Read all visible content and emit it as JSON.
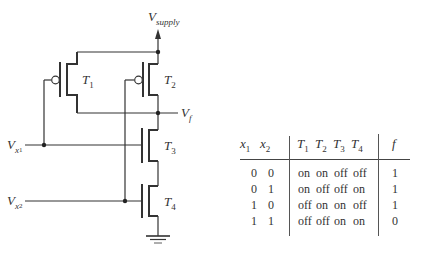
{
  "circuit": {
    "supply_label": {
      "main": "V",
      "sub": "supply"
    },
    "output_label": {
      "main": "V",
      "sub": "f"
    },
    "input1_label": {
      "main": "V",
      "sub": "x",
      "subsub": "1"
    },
    "input2_label": {
      "main": "V",
      "sub": "x",
      "subsub": "2"
    },
    "transistors": [
      {
        "label": "T",
        "sub": "1",
        "type": "pmos"
      },
      {
        "label": "T",
        "sub": "2",
        "type": "pmos"
      },
      {
        "label": "T",
        "sub": "3",
        "type": "nmos"
      },
      {
        "label": "T",
        "sub": "4",
        "type": "nmos"
      }
    ]
  },
  "truth_table": {
    "headers": [
      {
        "main": "x",
        "sub": "1"
      },
      {
        "main": "x",
        "sub": "2"
      },
      {
        "main": "T",
        "sub": "1"
      },
      {
        "main": "T",
        "sub": "2"
      },
      {
        "main": "T",
        "sub": "3"
      },
      {
        "main": "T",
        "sub": "4"
      },
      {
        "main": "f",
        "sub": ""
      }
    ],
    "rows": [
      [
        "0",
        "0",
        "on",
        "on",
        "off",
        "off",
        "1"
      ],
      [
        "0",
        "1",
        "on",
        "off",
        "off",
        "on",
        "1"
      ],
      [
        "1",
        "0",
        "off",
        "on",
        "on",
        "off",
        "1"
      ],
      [
        "1",
        "1",
        "off",
        "off",
        "on",
        "on",
        "0"
      ]
    ]
  },
  "colors": {
    "line": "#333333",
    "text": "#333333"
  }
}
